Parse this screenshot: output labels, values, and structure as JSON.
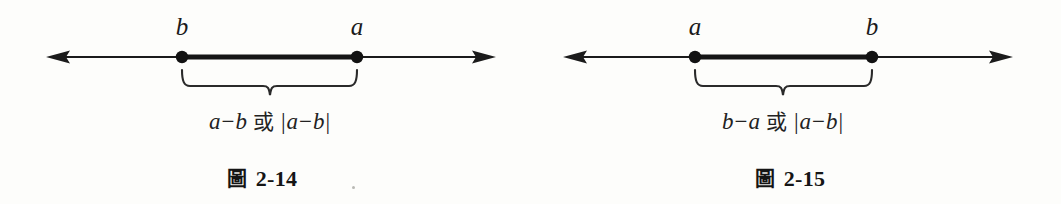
{
  "canvas": {
    "width": 1061,
    "height": 204,
    "background": "#fdfdfb",
    "ink": "#1b1b1b"
  },
  "figures": [
    {
      "id": "figure-2-14",
      "caption_cjk": "圖",
      "caption_number": "2-14",
      "caption_text": "圖 2-14",
      "axis_y": 57,
      "arrow_left_x": 46,
      "arrow_right_x": 496,
      "left_point": {
        "label": "b",
        "x": 182,
        "label_y": 14
      },
      "right_point": {
        "label": "a",
        "x": 357,
        "label_y": 14
      },
      "segment": {
        "from_x": 182,
        "to_x": 357,
        "thickness": 5
      },
      "brace": {
        "left_x": 182,
        "right_x": 357,
        "top_y": 70,
        "line_y": 86,
        "tick_y": 95,
        "mid_x": 270
      },
      "expression": {
        "text": "a−b 或 |a−b|",
        "first_term": {
          "minuend": "a",
          "operator": "−",
          "subtrahend": "b"
        },
        "conjunction": "或",
        "absolute_value": {
          "open": "|",
          "minuend": "a",
          "operator": "−",
          "subtrahend": "b",
          "close": "|"
        },
        "center_x": 270,
        "y": 110
      },
      "caption_center_x": 262,
      "caption_y": 168
    },
    {
      "id": "figure-2-15",
      "caption_cjk": "圖",
      "caption_number": "2-15",
      "caption_text": "圖 2-15",
      "axis_y": 57,
      "arrow_left_x": 563,
      "arrow_right_x": 1013,
      "left_point": {
        "label": "a",
        "x": 695,
        "label_y": 14
      },
      "right_point": {
        "label": "b",
        "x": 872,
        "label_y": 14
      },
      "segment": {
        "from_x": 695,
        "to_x": 872,
        "thickness": 5
      },
      "brace": {
        "left_x": 695,
        "right_x": 872,
        "top_y": 70,
        "line_y": 86,
        "tick_y": 95,
        "mid_x": 783
      },
      "expression": {
        "text": "b−a 或 |a−b|",
        "first_term": {
          "minuend": "b",
          "operator": "−",
          "subtrahend": "a"
        },
        "conjunction": "或",
        "absolute_value": {
          "open": "|",
          "minuend": "a",
          "operator": "−",
          "subtrahend": "b",
          "close": "|"
        },
        "center_x": 783,
        "y": 110
      },
      "caption_center_x": 790,
      "caption_y": 168
    }
  ]
}
